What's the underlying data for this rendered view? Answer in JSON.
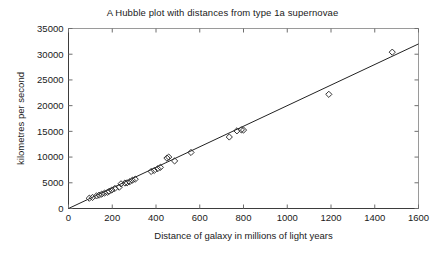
{
  "chart_data": {
    "type": "scatter",
    "title": "A Hubble plot with distances from type 1a supernovae",
    "xlabel": "Distance of galaxy in millions of light years",
    "ylabel": "kilometres per second",
    "xlim": [
      0,
      1600
    ],
    "ylim": [
      0,
      35000
    ],
    "xticks": [
      0,
      200,
      400,
      600,
      800,
      1000,
      1200,
      1400,
      1600
    ],
    "yticks": [
      0,
      5000,
      10000,
      15000,
      20000,
      25000,
      30000,
      35000
    ],
    "xtick_labels": [
      "0",
      "200",
      "400",
      "600",
      "800",
      "1000",
      "1200",
      "1400",
      "1600"
    ],
    "ytick_labels": [
      "0",
      "5000",
      "10000",
      "15000",
      "20000",
      "25000",
      "30000",
      "35000"
    ],
    "grid": false,
    "legend": false,
    "marker_style": "open-diamond",
    "marker_color": "#333333",
    "series": [
      {
        "name": "Type 1a supernovae",
        "points": [
          [
            95,
            2000
          ],
          [
            110,
            2150
          ],
          [
            128,
            2450
          ],
          [
            140,
            2600
          ],
          [
            152,
            2800
          ],
          [
            165,
            3000
          ],
          [
            178,
            3150
          ],
          [
            186,
            3350
          ],
          [
            198,
            3600
          ],
          [
            212,
            3900
          ],
          [
            232,
            4150
          ],
          [
            240,
            4800
          ],
          [
            258,
            4950
          ],
          [
            268,
            5000
          ],
          [
            280,
            5200
          ],
          [
            292,
            5500
          ],
          [
            305,
            5700
          ],
          [
            378,
            7200
          ],
          [
            392,
            7400
          ],
          [
            408,
            7750
          ],
          [
            420,
            8000
          ],
          [
            450,
            9800
          ],
          [
            458,
            10000
          ],
          [
            485,
            9250
          ],
          [
            560,
            10900
          ],
          [
            735,
            13900
          ],
          [
            770,
            15100
          ],
          [
            790,
            15300
          ],
          [
            800,
            15250
          ],
          [
            1190,
            22200
          ],
          [
            1480,
            30400
          ]
        ]
      }
    ],
    "fit_line": {
      "name": "Hubble fit line",
      "through_origin": true,
      "slope_km_s_per_mly": 20,
      "x_start": 0,
      "y_start": 0,
      "x_end": 1600,
      "y_end": 32000
    }
  }
}
